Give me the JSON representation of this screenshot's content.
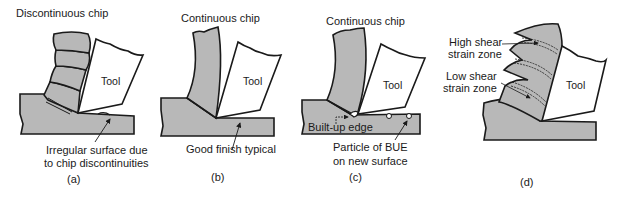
{
  "panels": [
    {
      "id": "a",
      "caption": "(a)",
      "title": "Discontinuous chip",
      "tool_label": "Tool",
      "annotation_line1": "Irregular surface due",
      "annotation_line2": "to chip discontinuities"
    },
    {
      "id": "b",
      "caption": "(b)",
      "title": "Continuous chip",
      "tool_label": "Tool",
      "annotation_line1": "Good finish typical"
    },
    {
      "id": "c",
      "caption": "(c)",
      "title": "Continuous chip",
      "tool_label": "Tool",
      "bue_label": "Built-up edge",
      "annotation_line1": "Particle of BUE",
      "annotation_line2": "on new surface"
    },
    {
      "id": "d",
      "caption": "(d)",
      "tool_label": "Tool",
      "high_zone_line1": "High shear",
      "high_zone_line2": "strain zone",
      "low_zone_line1": "Low shear",
      "low_zone_line2": "strain zone"
    }
  ],
  "colors": {
    "chip_fill": "#b8b8b8",
    "workpiece_fill": "#b8b8b8",
    "tool_fill": "#ffffff",
    "stroke": "#1a1a1a"
  }
}
